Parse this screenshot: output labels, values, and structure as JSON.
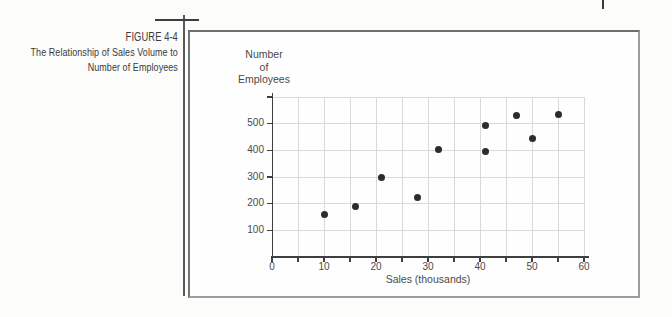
{
  "figure": {
    "label": "FIGURE 4-4",
    "caption_lines": [
      "The Relationship of Sales Volume to",
      "Number of Employees"
    ]
  },
  "chart_data": {
    "type": "scatter",
    "xlabel": "Sales (thousands)",
    "ylabel": "Number of Employees",
    "ylabel_lines": [
      "Number",
      "of",
      "Employees"
    ],
    "xlim": [
      0,
      60
    ],
    "ylim": [
      0,
      600
    ],
    "x_major_ticks": [
      0,
      10,
      20,
      30,
      40,
      50,
      60
    ],
    "x_minor_step": 5,
    "y_major_ticks": [
      100,
      200,
      300,
      400,
      500
    ],
    "x_grid_step": 5,
    "y_grid_step": 100,
    "grid": "on",
    "points": [
      {
        "sales": 10,
        "employees": 160
      },
      {
        "sales": 16,
        "employees": 190
      },
      {
        "sales": 21,
        "employees": 300
      },
      {
        "sales": 28,
        "employees": 225
      },
      {
        "sales": 32,
        "employees": 405
      },
      {
        "sales": 41,
        "employees": 395
      },
      {
        "sales": 41,
        "employees": 495
      },
      {
        "sales": 47,
        "employees": 530
      },
      {
        "sales": 50,
        "employees": 445
      },
      {
        "sales": 55,
        "employees": 535
      }
    ],
    "colors": {
      "point": "#2c2c2c",
      "grid": "#d9d9d9",
      "axis": "#3f3f3f",
      "text": "#4a4a4a"
    }
  }
}
